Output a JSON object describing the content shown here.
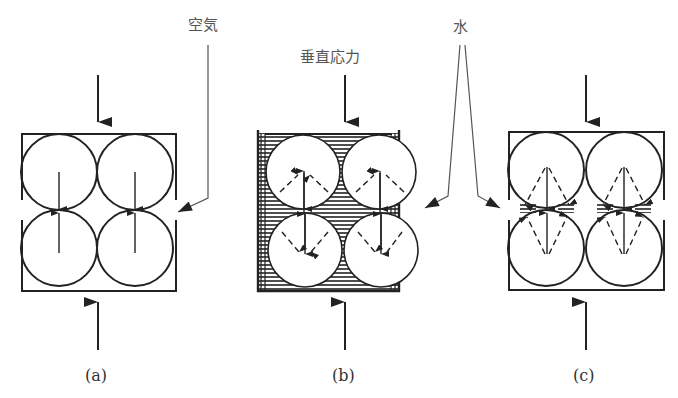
{
  "labels": {
    "air": "空気",
    "vertical_stress": "垂直応力",
    "water": "水"
  },
  "captions": {
    "a": "(a)",
    "b": "(b)",
    "c": "(c)"
  },
  "colors": {
    "line": "#222222",
    "leader": "#555555",
    "text": "#555555"
  }
}
